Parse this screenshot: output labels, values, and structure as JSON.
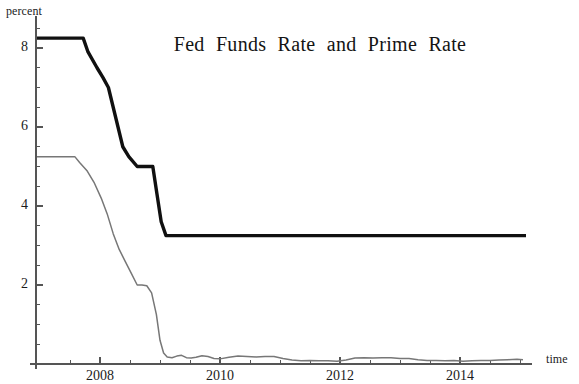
{
  "chart_data": {
    "type": "line",
    "title": "Fed Funds Rate and Prime Rate",
    "xlabel": "time",
    "ylabel": "percent",
    "grid": false,
    "legend": "none",
    "xlim": [
      2006.9,
      2015.1
    ],
    "ylim": [
      0,
      8.8
    ],
    "x_ticks_major": [
      2008,
      2010,
      2012,
      2014
    ],
    "x_tick_labels": [
      "2008",
      "2010",
      "2012",
      "2014"
    ],
    "x_ticks_minor": [
      2007.5,
      2008.5,
      2009,
      2009.5,
      2010.5,
      2011,
      2011.5,
      2012.5,
      2013,
      2013.5,
      2014.5,
      2015
    ],
    "y_ticks_major": [
      2,
      4,
      6,
      8
    ],
    "y_tick_labels": [
      "2",
      "4",
      "6",
      "8"
    ],
    "y_ticks_minor": [
      0.5,
      1,
      1.5,
      2.5,
      3,
      3.5,
      4.5,
      5,
      5.5,
      6.5,
      7,
      7.5,
      8.5
    ],
    "series": [
      {
        "name": "Prime Rate",
        "color": "#101010",
        "width": 3.4,
        "x": [
          2006.95,
          2007.55,
          2007.72,
          2007.8,
          2007.95,
          2008.05,
          2008.14,
          2008.22,
          2008.3,
          2008.38,
          2008.48,
          2008.62,
          2008.78,
          2008.88,
          2008.95,
          2009.02,
          2009.1,
          2010.0,
          2011.0,
          2012.0,
          2013.0,
          2014.0,
          2015.0,
          2015.1
        ],
        "y": [
          8.25,
          8.25,
          8.25,
          7.9,
          7.5,
          7.25,
          7.0,
          6.5,
          6.0,
          5.5,
          5.25,
          5.0,
          5.0,
          5.0,
          4.3,
          3.6,
          3.25,
          3.25,
          3.25,
          3.25,
          3.25,
          3.25,
          3.25,
          3.25
        ]
      },
      {
        "name": "Fed Funds Rate",
        "color": "#777777",
        "width": 1.5,
        "x": [
          2006.95,
          2007.3,
          2007.58,
          2007.66,
          2007.78,
          2007.9,
          2008.02,
          2008.12,
          2008.22,
          2008.32,
          2008.42,
          2008.52,
          2008.62,
          2008.7,
          2008.78,
          2008.86,
          2008.94,
          2009.0,
          2009.06,
          2009.12,
          2009.2,
          2009.28,
          2009.36,
          2009.44,
          2009.52,
          2009.6,
          2009.7,
          2009.8,
          2009.9,
          2010.0,
          2010.15,
          2010.3,
          2010.45,
          2010.6,
          2010.75,
          2010.9,
          2011.05,
          2011.2,
          2011.35,
          2011.5,
          2011.65,
          2011.8,
          2011.95,
          2012.1,
          2012.25,
          2012.4,
          2012.55,
          2012.7,
          2012.85,
          2013.0,
          2013.15,
          2013.3,
          2013.45,
          2013.6,
          2013.75,
          2013.9,
          2014.05,
          2014.2,
          2014.35,
          2014.5,
          2014.65,
          2014.8,
          2014.95,
          2015.05
        ],
        "y": [
          5.25,
          5.25,
          5.25,
          5.1,
          4.9,
          4.6,
          4.2,
          3.8,
          3.3,
          2.9,
          2.6,
          2.3,
          2.0,
          2.0,
          1.98,
          1.8,
          1.25,
          0.6,
          0.28,
          0.18,
          0.16,
          0.2,
          0.22,
          0.16,
          0.15,
          0.17,
          0.21,
          0.19,
          0.14,
          0.13,
          0.17,
          0.2,
          0.19,
          0.18,
          0.19,
          0.19,
          0.14,
          0.1,
          0.08,
          0.09,
          0.08,
          0.08,
          0.07,
          0.1,
          0.15,
          0.16,
          0.15,
          0.16,
          0.16,
          0.14,
          0.14,
          0.11,
          0.09,
          0.09,
          0.08,
          0.09,
          0.07,
          0.08,
          0.09,
          0.09,
          0.1,
          0.11,
          0.12,
          0.11
        ]
      }
    ],
    "notes": {
      "start_value_prime": "8.25",
      "end_value_prime": "3.25",
      "start_value_fedfunds": "5.25",
      "plateau_prime": "5.0",
      "plateau_fedfunds": "2.0"
    }
  },
  "axis_colors": {
    "axis_line": "#555555",
    "tick": "#555555"
  }
}
